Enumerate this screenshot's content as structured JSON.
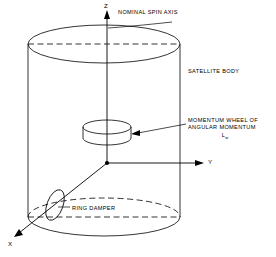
{
  "figure": {
    "background_color": "#ffffff",
    "line_color": "#000000",
    "text_color": "#000000"
  },
  "axes": {
    "z": {
      "label": "Z",
      "direction": "up",
      "annotation": "NOMINAL SPIN AXIS"
    },
    "y": {
      "label": "Y",
      "direction": "right"
    },
    "x": {
      "label": "X",
      "direction": "down-left"
    },
    "origin_label": "origin"
  },
  "labels": {
    "spin_axis": "NOMINAL SPIN AXIS",
    "satellite_body": "SATELLITE BODY",
    "momentum_wheel_line1": "MOMENTUM WHEEL OF",
    "momentum_wheel_line2": "ANGULAR MOMENTUM",
    "momentum_wheel_symbol": "L",
    "momentum_wheel_subscript": "w",
    "ring_damper": "RING DAMPER"
  },
  "components": {
    "satellite_body": {
      "name": "cylindrical satellite body",
      "shape": "cylinder"
    },
    "momentum_wheel": {
      "name": "momentum wheel",
      "shape": "small disk on spin axis"
    },
    "ring_damper": {
      "name": "ring damper",
      "shape": "narrow tilted ellipse near lower left"
    }
  }
}
